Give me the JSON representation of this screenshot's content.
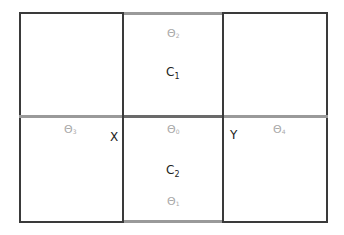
{
  "diagram": {
    "type": "grid",
    "colors": {
      "border_dark": "#3a3a3a",
      "border_gray": "#9a9a9a",
      "theta_text": "#a9a9a9",
      "text": "#222222"
    },
    "cells": [
      {
        "id": "C1",
        "base": "C",
        "sub": "1"
      },
      {
        "id": "C2",
        "base": "C",
        "sub": "2"
      }
    ],
    "thetas": [
      {
        "id": "theta2",
        "base": "Θ",
        "sub": "2"
      },
      {
        "id": "theta3",
        "base": "Θ",
        "sub": "3"
      },
      {
        "id": "theta0",
        "base": "Θ",
        "sub": "0"
      },
      {
        "id": "theta4",
        "base": "Θ",
        "sub": "4"
      },
      {
        "id": "theta1",
        "base": "Θ",
        "sub": "1"
      }
    ],
    "points": [
      {
        "id": "X",
        "label": "X"
      },
      {
        "id": "Y",
        "label": "Y"
      }
    ]
  }
}
